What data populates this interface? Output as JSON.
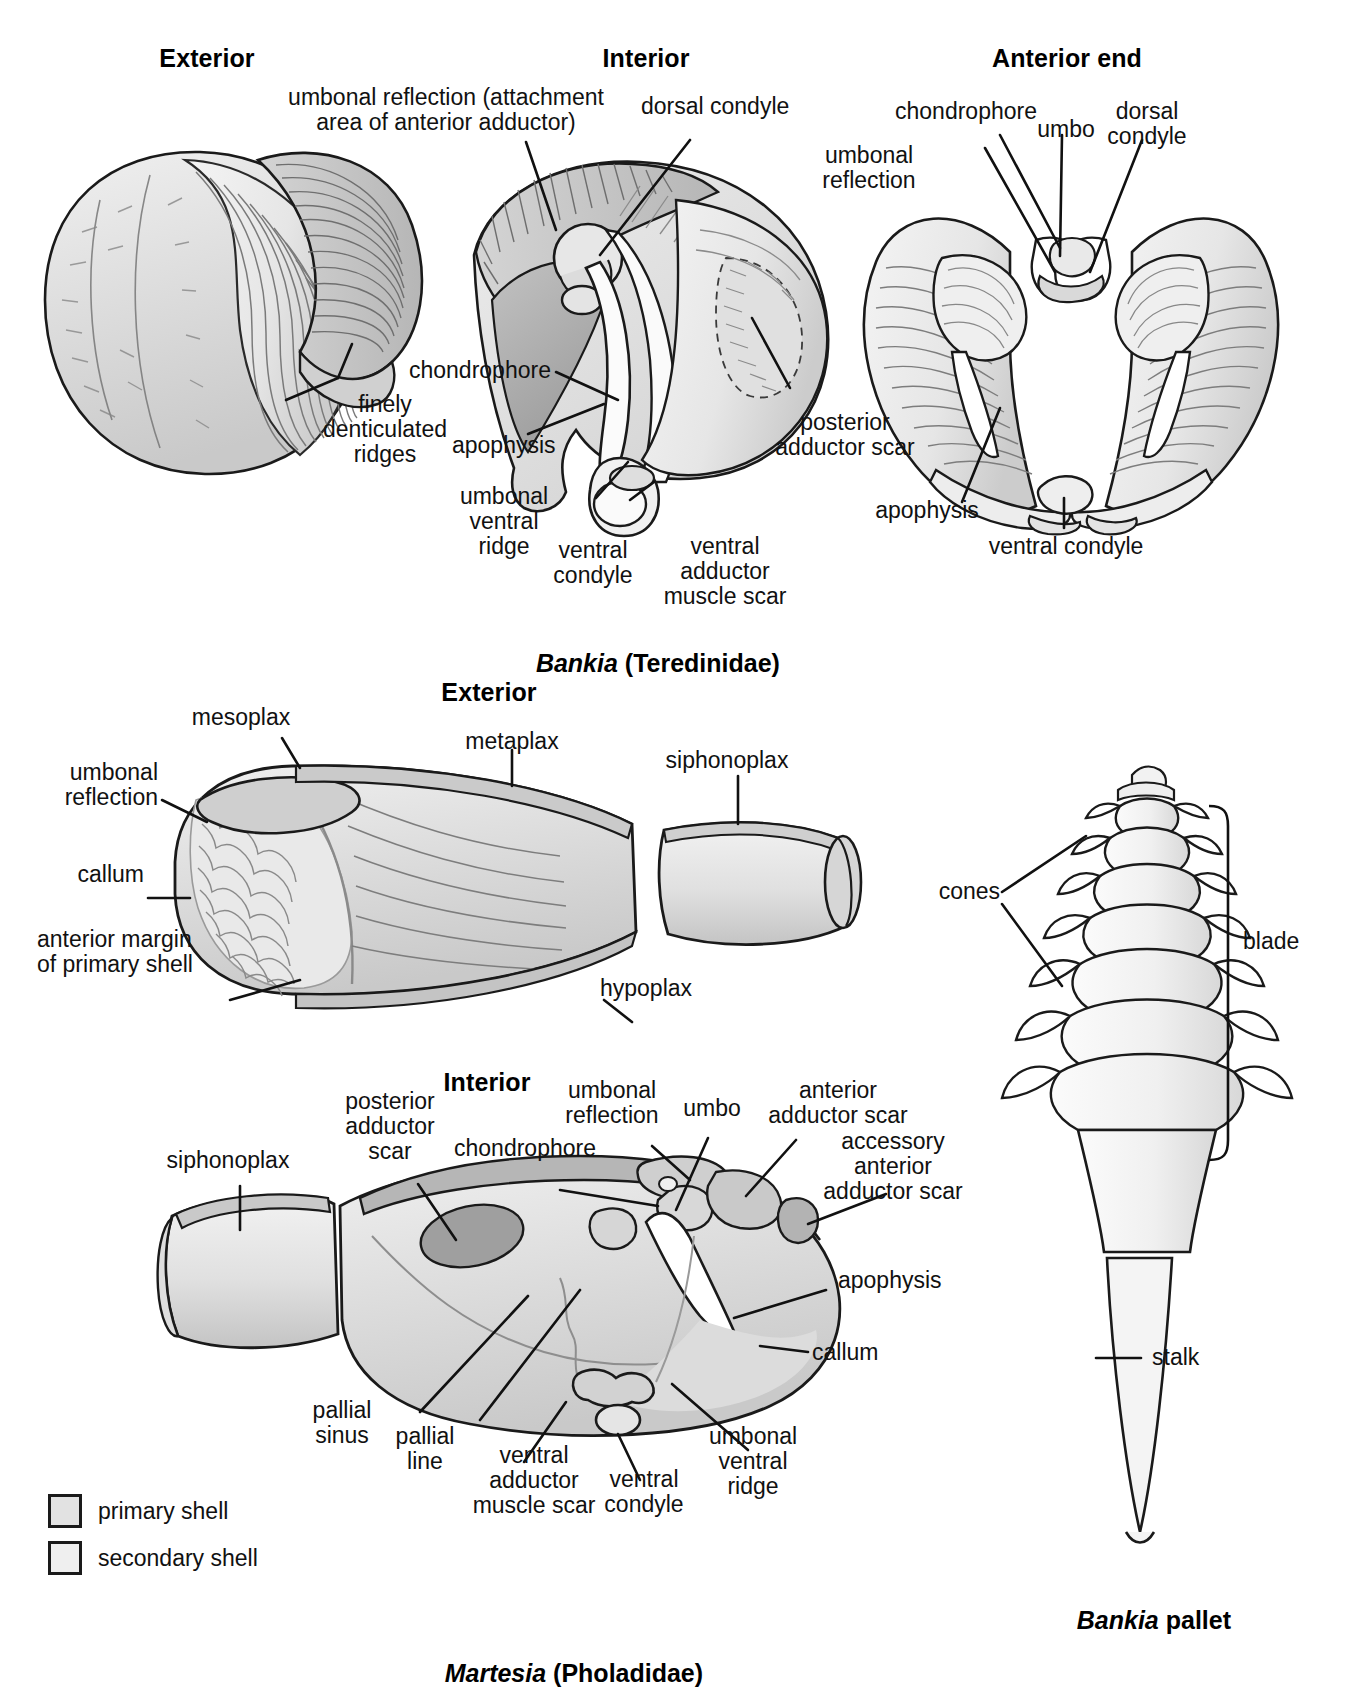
{
  "figure": {
    "title_top_cut": "",
    "panels": [
      {
        "id": "bankia-exterior",
        "heading": "Exterior",
        "labels": [
          {
            "key": "finely_denticulated_ridges",
            "text": "finely\ndenticulated\nridges"
          }
        ]
      },
      {
        "id": "bankia-interior",
        "heading": "Interior",
        "labels": [
          {
            "key": "umbonal_reflection_attachment",
            "text": "umbonal reflection (attachment\narea of anterior adductor)"
          },
          {
            "key": "dorsal_condyle",
            "text": "dorsal condyle"
          },
          {
            "key": "chondrophore",
            "text": "chondrophore"
          },
          {
            "key": "apophysis",
            "text": "apophysis"
          },
          {
            "key": "umbonal_ventral_ridge",
            "text": "umbonal\nventral\nridge"
          },
          {
            "key": "ventral_condyle",
            "text": "ventral\ncondyle"
          },
          {
            "key": "ventral_adductor_muscle_scar",
            "text": "ventral\nadductor\nmuscle scar"
          },
          {
            "key": "posterior_adductor_scar",
            "text": "posterior\nadductor scar"
          }
        ]
      },
      {
        "id": "bankia-anterior-end",
        "heading": "Anterior end",
        "labels": [
          {
            "key": "chondrophore",
            "text": "chondrophore"
          },
          {
            "key": "umbo",
            "text": "umbo"
          },
          {
            "key": "dorsal_condyle",
            "text": "dorsal\ncondyle"
          },
          {
            "key": "umbonal_reflection",
            "text": "umbonal\nreflection"
          },
          {
            "key": "apophysis",
            "text": "apophysis"
          },
          {
            "key": "ventral_condyle",
            "text": "ventral condyle"
          }
        ]
      },
      {
        "id": "martesia-exterior",
        "heading": "Exterior",
        "labels": [
          {
            "key": "mesoplax",
            "text": "mesoplax"
          },
          {
            "key": "umbonal_reflection",
            "text": "umbonal\nreflection"
          },
          {
            "key": "callum",
            "text": "callum"
          },
          {
            "key": "anterior_margin_of_primary_shell",
            "text": "anterior margin\nof primary shell"
          },
          {
            "key": "metaplax",
            "text": "metaplax"
          },
          {
            "key": "siphonoplax",
            "text": "siphonoplax"
          },
          {
            "key": "hypoplax",
            "text": "hypoplax"
          }
        ]
      },
      {
        "id": "martesia-interior",
        "heading": "Interior",
        "labels": [
          {
            "key": "siphonoplax",
            "text": "siphonoplax"
          },
          {
            "key": "posterior_adductor_scar",
            "text": "posterior\nadductor\nscar"
          },
          {
            "key": "chondrophore",
            "text": "chondrophore"
          },
          {
            "key": "umbonal_reflection",
            "text": "umbonal\nreflection"
          },
          {
            "key": "umbo",
            "text": "umbo"
          },
          {
            "key": "anterior_adductor_scar",
            "text": "anterior\nadductor scar"
          },
          {
            "key": "accessory_anterior_adductor_scar",
            "text": "accessory\nanterior\nadductor scar"
          },
          {
            "key": "apophysis",
            "text": "apophysis"
          },
          {
            "key": "callum",
            "text": "callum"
          },
          {
            "key": "pallial_sinus",
            "text": "pallial\nsinus"
          },
          {
            "key": "pallial_line",
            "text": "pallial\nline"
          },
          {
            "key": "ventral_adductor_muscle_scar",
            "text": "ventral\nadductor\nmuscle scar"
          },
          {
            "key": "ventral_condyle",
            "text": "ventral\ncondyle"
          },
          {
            "key": "umbonal_ventral_ridge",
            "text": "umbonal\nventral\nridge"
          }
        ]
      },
      {
        "id": "bankia-pallet",
        "heading": "",
        "labels": [
          {
            "key": "cones",
            "text": "cones"
          },
          {
            "key": "blade",
            "text": "blade"
          },
          {
            "key": "stalk",
            "text": "stalk"
          }
        ]
      }
    ],
    "captions": [
      {
        "key": "bankia_teredinidae",
        "italic": "Bankia",
        "rest": " (Teredinidae)"
      },
      {
        "key": "martesia_pholadidae",
        "italic": "Martesia",
        "rest": " (Pholadidae)"
      },
      {
        "key": "bankia_pallet",
        "italic": "Bankia",
        "rest": " pallet"
      }
    ],
    "legend": {
      "items": [
        {
          "key": "primary_shell",
          "label": "primary shell",
          "swatch": "#e2e2e2"
        },
        {
          "key": "secondary_shell",
          "label": "secondary shell",
          "swatch": "#efefef"
        }
      ]
    },
    "colors": {
      "ink": "#111111",
      "shell_light": "#efefef",
      "shell_mid": "#dcdcdc",
      "shell_dark": "#bdbdbd",
      "scar_dark": "#9e9e9e"
    }
  }
}
